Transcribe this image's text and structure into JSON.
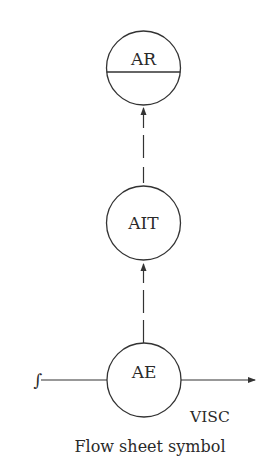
{
  "diagram": {
    "caption": "Flow sheet symbol",
    "stream_label": "VISC",
    "line_symbol": "∫",
    "nodes": [
      {
        "id": "AR",
        "label": "AR",
        "type": "recorder",
        "divided": true
      },
      {
        "id": "AIT",
        "label": "AIT",
        "type": "indicating-transmitter",
        "divided": false
      },
      {
        "id": "AE",
        "label": "AE",
        "type": "element",
        "divided": false
      }
    ],
    "connections": [
      {
        "from": "AE",
        "to": "AIT",
        "style": "dashed",
        "arrow": true
      },
      {
        "from": "AIT",
        "to": "AR",
        "style": "dashed",
        "arrow": true
      }
    ],
    "process_line": {
      "direction": "left-to-right",
      "arrow": true
    },
    "colors": {
      "stroke": "#333333",
      "background": "#ffffff"
    }
  }
}
